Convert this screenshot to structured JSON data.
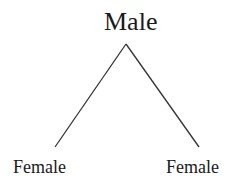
{
  "diagram": {
    "type": "tree",
    "root": {
      "label": "Male"
    },
    "children": [
      {
        "label": "Female"
      },
      {
        "label": "Female"
      }
    ],
    "colors": {
      "line": "#333333",
      "text": "#1a1a1a",
      "background": "#ffffff"
    }
  }
}
